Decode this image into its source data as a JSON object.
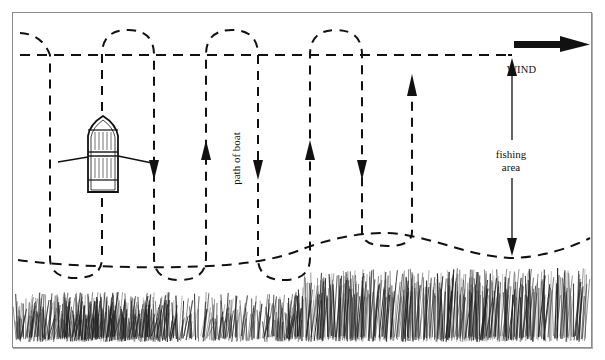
{
  "diagram": {
    "labels": {
      "wind": "WIND",
      "fishing_area_line1": "fishing",
      "fishing_area_line2": "area",
      "path_of_boat": "path of boat"
    },
    "elements": {
      "boat": "rowboat with oars",
      "path": "dashed serpentine boat path with U-turn loops",
      "top_boundary": "dashed straight line",
      "bottom_boundary": "dashed wavy line along shore",
      "shore": "grass / reeds along bottom edge",
      "wind_arrow": "bold arrow pointing right",
      "fishing_area_arrow": "double-headed vertical arrow"
    },
    "path_direction_arrows": [
      "down",
      "up",
      "down",
      "up",
      "down",
      "up"
    ],
    "colors": {
      "ink": "#111111",
      "frame": "#8a8a8a",
      "background": "#ffffff"
    }
  }
}
